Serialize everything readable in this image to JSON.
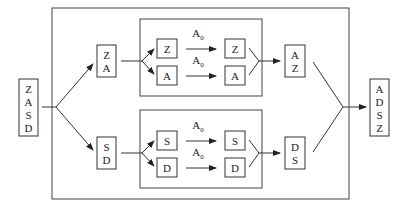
{
  "diagram": {
    "input": {
      "letters": [
        "Z",
        "A",
        "S",
        "D"
      ]
    },
    "split_top": {
      "letters": [
        "Z",
        "A"
      ]
    },
    "split_bottom": {
      "letters": [
        "S",
        "D"
      ]
    },
    "upper_module": {
      "rows": [
        {
          "in": "Z",
          "op": "A",
          "op_sub": "0",
          "out": "Z"
        },
        {
          "in": "A",
          "op": "A",
          "op_sub": "0",
          "out": "A"
        }
      ]
    },
    "lower_module": {
      "rows": [
        {
          "in": "S",
          "op": "A",
          "op_sub": "0",
          "out": "S"
        },
        {
          "in": "D",
          "op": "A",
          "op_sub": "0",
          "out": "D"
        }
      ]
    },
    "merge_top": {
      "letters": [
        "A",
        "Z"
      ]
    },
    "merge_bottom": {
      "letters": [
        "D",
        "S"
      ]
    },
    "output": {
      "letters": [
        "A",
        "D",
        "S",
        "Z"
      ]
    }
  }
}
